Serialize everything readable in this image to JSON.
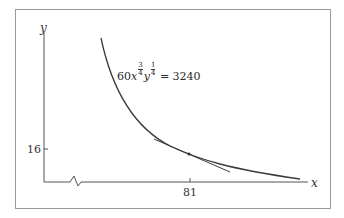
{
  "diagram": {
    "type": "indifference/isoquant curve with tangent line",
    "axes": {
      "x_label": "x",
      "y_label": "y",
      "x_tick": "81",
      "y_tick": "16",
      "x_axis_break": true
    },
    "curve": {
      "equation_prefix": "60",
      "var_x": "x",
      "exp_x_num": "3",
      "exp_x_den": "4",
      "var_y": "y",
      "exp_y_num": "1",
      "exp_y_den": "4",
      "equals": "= 3240"
    },
    "tangent_point": {
      "x": "81",
      "y": "16"
    },
    "colors": {
      "curve": "#3a3a3a",
      "axes": "#555555",
      "frame": "#9a9a9a"
    }
  }
}
